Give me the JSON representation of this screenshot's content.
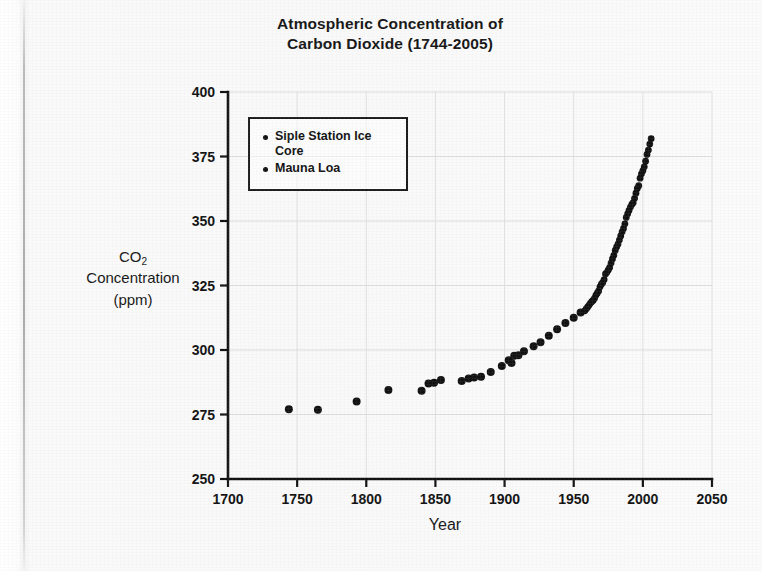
{
  "title": {
    "line1": "Atmospheric Concentration of",
    "line2": "Carbon Dioxide (1744-2005)"
  },
  "axes": {
    "y_title_line1": "CO",
    "y_title_sub": "2",
    "y_title_line2": "Concentration",
    "y_title_line3": "(ppm)",
    "x_title": "Year"
  },
  "legend": {
    "items": [
      {
        "label": "Siple Station Ice Core",
        "marker": "dot",
        "color": "#111111"
      },
      {
        "label": "Mauna Loa",
        "marker": "dot",
        "color": "#111111"
      }
    ]
  },
  "chart_data": {
    "type": "scatter",
    "title": "Atmospheric Concentration of Carbon Dioxide (1744-2005)",
    "xlabel": "Year",
    "ylabel": "CO2 Concentration (ppm)",
    "xlim": [
      1700,
      2050
    ],
    "ylim": [
      250,
      400
    ],
    "xticks": [
      1700,
      1750,
      1800,
      1850,
      1900,
      1950,
      2000,
      2050
    ],
    "yticks": [
      250,
      275,
      300,
      325,
      350,
      375,
      400
    ],
    "grid": "faint",
    "legend_position": "upper-left-inside",
    "marker_color": "#111111",
    "series": [
      {
        "name": "Siple Station Ice Core",
        "points": [
          [
            1744,
            277.0
          ],
          [
            1765,
            276.8
          ],
          [
            1793,
            280.0
          ],
          [
            1816,
            284.5
          ],
          [
            1840,
            284.2
          ],
          [
            1845,
            287.0
          ],
          [
            1849,
            287.3
          ],
          [
            1854,
            288.4
          ],
          [
            1869,
            288.0
          ],
          [
            1874,
            289.0
          ],
          [
            1878,
            289.3
          ],
          [
            1883,
            289.6
          ],
          [
            1890,
            291.5
          ],
          [
            1898,
            293.8
          ],
          [
            1903,
            296.0
          ],
          [
            1905,
            295.0
          ],
          [
            1907,
            297.8
          ],
          [
            1910,
            298.0
          ],
          [
            1914,
            299.5
          ],
          [
            1921,
            301.5
          ],
          [
            1926,
            303.0
          ],
          [
            1932,
            305.5
          ],
          [
            1938,
            308.0
          ],
          [
            1944,
            310.5
          ],
          [
            1950,
            312.5
          ],
          [
            1955,
            314.5
          ]
        ]
      },
      {
        "name": "Mauna Loa",
        "points": [
          [
            1958,
            315.2
          ],
          [
            1959,
            315.9
          ],
          [
            1960,
            316.6
          ],
          [
            1961,
            317.3
          ],
          [
            1962,
            318.1
          ],
          [
            1963,
            318.7
          ],
          [
            1964,
            319.2
          ],
          [
            1965,
            320.0
          ],
          [
            1966,
            321.2
          ],
          [
            1967,
            322.0
          ],
          [
            1968,
            322.9
          ],
          [
            1969,
            324.5
          ],
          [
            1970,
            325.5
          ],
          [
            1971,
            326.2
          ],
          [
            1972,
            327.3
          ],
          [
            1973,
            329.5
          ],
          [
            1974,
            330.1
          ],
          [
            1975,
            331.0
          ],
          [
            1976,
            332.0
          ],
          [
            1977,
            333.7
          ],
          [
            1978,
            335.3
          ],
          [
            1979,
            336.7
          ],
          [
            1980,
            338.6
          ],
          [
            1981,
            339.9
          ],
          [
            1982,
            341.0
          ],
          [
            1983,
            342.6
          ],
          [
            1984,
            344.2
          ],
          [
            1985,
            345.8
          ],
          [
            1986,
            347.1
          ],
          [
            1987,
            348.9
          ],
          [
            1988,
            351.4
          ],
          [
            1989,
            352.8
          ],
          [
            1990,
            354.1
          ],
          [
            1991,
            355.4
          ],
          [
            1992,
            356.4
          ],
          [
            1993,
            357.1
          ],
          [
            1994,
            358.8
          ],
          [
            1995,
            360.8
          ],
          [
            1996,
            362.6
          ],
          [
            1997,
            363.7
          ],
          [
            1998,
            366.6
          ],
          [
            1999,
            368.3
          ],
          [
            2000,
            369.5
          ],
          [
            2001,
            371.0
          ],
          [
            2002,
            373.2
          ],
          [
            2003,
            375.8
          ],
          [
            2004,
            377.5
          ],
          [
            2005,
            379.8
          ],
          [
            2006,
            381.9
          ]
        ]
      }
    ]
  }
}
